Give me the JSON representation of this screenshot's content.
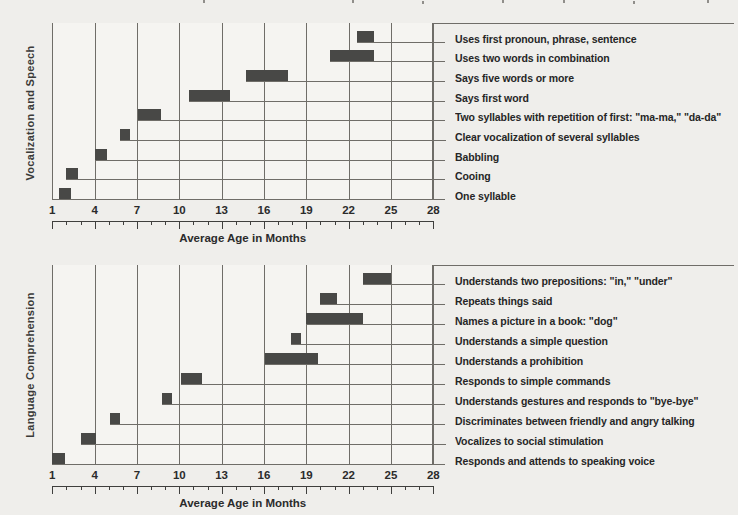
{
  "colors": {
    "page_bg": "#efeeeb",
    "plot_bg": "#f5f4f1",
    "bar": "#484846",
    "grid": "#6f6d68",
    "axis": "#3f3f3d",
    "band_bg": "#9d9d9b",
    "band_text": "#3a3a38",
    "label_text": "#262626"
  },
  "chart_data": [
    {
      "type": "bar",
      "orientation": "horizontal-range",
      "category": "Vocalization and Speech",
      "xlabel": "Average Age in Months",
      "xlim": [
        1,
        28
      ],
      "x_ticks": [
        1,
        4,
        7,
        10,
        13,
        16,
        19,
        22,
        25,
        28
      ],
      "x_minor_step": 1,
      "grid": "vertical-on",
      "legend": "none",
      "items": [
        {
          "label": "Uses first pronoun, phrase, sentence",
          "start": 22.6,
          "end": 23.8
        },
        {
          "label": "Uses two words in combination",
          "start": 20.7,
          "end": 23.8
        },
        {
          "label": "Says five words or more",
          "start": 14.7,
          "end": 17.7
        },
        {
          "label": "Says first word",
          "start": 10.7,
          "end": 13.6
        },
        {
          "label": "Two syllables with repetition of first: \"ma-ma,\" \"da-da\"",
          "start": 7.1,
          "end": 8.7
        },
        {
          "label": "Clear vocalization of several syllables",
          "start": 5.8,
          "end": 6.5
        },
        {
          "label": "Babbling",
          "start": 4.0,
          "end": 4.9
        },
        {
          "label": "Cooing",
          "start": 2.0,
          "end": 2.8
        },
        {
          "label": "One syllable",
          "start": 1.5,
          "end": 2.3
        }
      ]
    },
    {
      "type": "bar",
      "orientation": "horizontal-range",
      "category": "Language Comprehension",
      "xlabel": "Average Age in Months",
      "xlim": [
        1,
        28
      ],
      "x_ticks": [
        1,
        4,
        7,
        10,
        13,
        16,
        19,
        22,
        25,
        28
      ],
      "x_minor_step": 1,
      "grid": "vertical-on",
      "legend": "none",
      "items": [
        {
          "label": "Understands two prepositions: \"in,\" \"under\"",
          "start": 23.0,
          "end": 25.0
        },
        {
          "label": "Repeats things said",
          "start": 20.0,
          "end": 21.2
        },
        {
          "label": "Names a picture in a book: \"dog\"",
          "start": 19.0,
          "end": 23.0
        },
        {
          "label": "Understands a simple question",
          "start": 17.9,
          "end": 18.6
        },
        {
          "label": "Understands a prohibition",
          "start": 16.1,
          "end": 19.8
        },
        {
          "label": "Responds to simple commands",
          "start": 10.1,
          "end": 11.6
        },
        {
          "label": "Understands gestures and responds to \"bye-bye\"",
          "start": 8.8,
          "end": 9.5
        },
        {
          "label": "Discriminates between friendly and angry talking",
          "start": 5.1,
          "end": 5.8
        },
        {
          "label": "Vocalizes to social stimulation",
          "start": 3.0,
          "end": 4.1
        },
        {
          "label": "Responds and attends to speaking voice",
          "start": 1.0,
          "end": 1.9
        }
      ]
    }
  ]
}
